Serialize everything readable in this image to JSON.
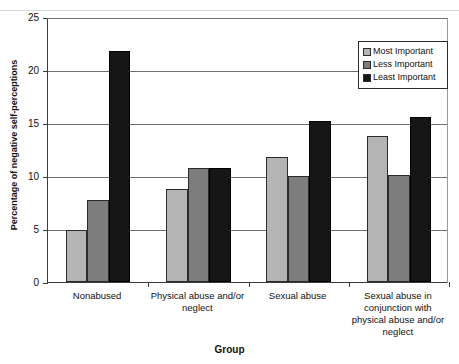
{
  "chart_data": {
    "type": "bar",
    "title": "",
    "xlabel": "Group",
    "ylabel": "Percentage of negative self-perceptions",
    "ylim": [
      0,
      25
    ],
    "ytick_step": 5,
    "yticks": [
      "0",
      "5",
      "10",
      "15",
      "20",
      "25"
    ],
    "grid": true,
    "legend_position": "top-right",
    "categories": [
      "Nonabused",
      "Physical abuse and/or neglect",
      "Sexual abuse",
      "Sexual abuse in conjunction with physical abuse and/or neglect"
    ],
    "category_lines": [
      [
        "Nonabused"
      ],
      [
        "Physical abuse and/or",
        "neglect"
      ],
      [
        "Sexual abuse"
      ],
      [
        "Sexual abuse in",
        "conjunction with",
        "physical abuse and/or",
        "neglect"
      ]
    ],
    "series": [
      {
        "name": "Most Important",
        "color": "#b4b4b4",
        "values": [
          4.9,
          8.8,
          11.8,
          13.8
        ]
      },
      {
        "name": "Less Important",
        "color": "#7d7d7d",
        "values": [
          7.7,
          10.8,
          10.0,
          10.1
        ]
      },
      {
        "name": "Least Important",
        "color": "#161616",
        "values": [
          21.8,
          10.8,
          15.2,
          15.6
        ]
      }
    ]
  },
  "legend": {
    "items": [
      {
        "label": "Most Important",
        "color": "#b4b4b4"
      },
      {
        "label": "Less Important",
        "color": "#7d7d7d"
      },
      {
        "label": "Least Important",
        "color": "#161616"
      }
    ]
  },
  "axes": {
    "x_title": "Group",
    "y_title": "Percentage of negative self-perceptions"
  }
}
